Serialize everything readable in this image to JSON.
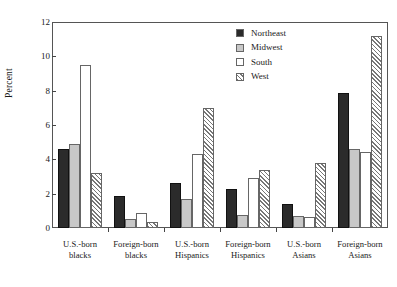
{
  "chart_data": {
    "type": "bar",
    "title": "",
    "subtitle": "",
    "xlabel": "",
    "ylabel": "Percent",
    "ylim": [
      0,
      12
    ],
    "yticks": [
      0,
      2,
      4,
      6,
      8,
      10,
      12
    ],
    "ytick_labels": [
      "0",
      "2",
      "4",
      "6",
      "8",
      "10",
      "12"
    ],
    "grid": false,
    "legend_position": "top-right",
    "categories": [
      "U.S.-born blacks",
      "Foreign-born blacks",
      "U.S.-born Hispanics",
      "Foreign-born Hispanics",
      "U.S.-born Asians",
      "Foreign-born Asians"
    ],
    "category_lines": [
      [
        "U.S.-born",
        "blacks"
      ],
      [
        "Foreign-born",
        "blacks"
      ],
      [
        "U.S.-born",
        "Hispanics"
      ],
      [
        "Foreign-born",
        "Hispanics"
      ],
      [
        "U.S.-born",
        "Asians"
      ],
      [
        "Foreign-born",
        "Asians"
      ]
    ],
    "series": [
      {
        "name": "Northeast",
        "fill": "solid-black",
        "color": "#2b2b2b",
        "values": [
          4.6,
          1.85,
          2.6,
          2.25,
          1.4,
          7.85
        ]
      },
      {
        "name": "Midwest",
        "fill": "light-gray",
        "color": "#c8c8c8",
        "values": [
          4.9,
          0.5,
          1.7,
          0.75,
          0.7,
          4.6
        ]
      },
      {
        "name": "South",
        "fill": "white",
        "color": "#ffffff",
        "values": [
          9.5,
          0.9,
          4.3,
          2.9,
          0.65,
          4.4
        ]
      },
      {
        "name": "West",
        "fill": "diagonal-hatch",
        "color": "#777777",
        "values": [
          3.2,
          0.35,
          7.0,
          3.4,
          3.8,
          11.2
        ]
      }
    ]
  },
  "legend": {
    "items": [
      {
        "label": "Northeast"
      },
      {
        "label": "Midwest"
      },
      {
        "label": "South"
      },
      {
        "label": "West"
      }
    ]
  }
}
